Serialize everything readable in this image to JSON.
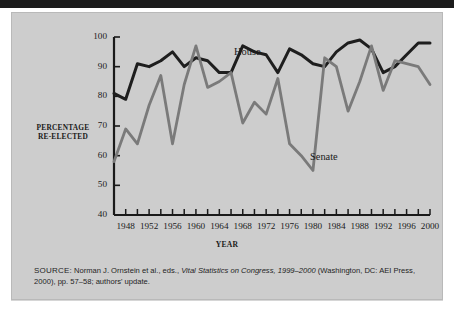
{
  "figure": {
    "ylabel_line1": "PERCENTAGE",
    "ylabel_line2": "RE-ELECTED",
    "xlabel": "YEAR",
    "source_keyword": "SOURCE:",
    "source_text_1": " Norman J. Ornstein et al., eds., ",
    "source_title": "Vital Statistics on Congress, 1999–2000",
    "source_text_2": " (Washington, DC: AEI Press, 2000), pp. 57–58; authors' update."
  },
  "chart_data": {
    "type": "line",
    "title": "",
    "xlabel": "YEAR",
    "ylabel": "PERCENTAGE RE-ELECTED",
    "xlim": [
      1946,
      2000
    ],
    "ylim": [
      40,
      100
    ],
    "yticks": [
      40,
      50,
      60,
      70,
      80,
      90,
      100
    ],
    "xticks": [
      1948,
      1952,
      1956,
      1960,
      1964,
      1968,
      1972,
      1976,
      1980,
      1984,
      1988,
      1992,
      1996,
      2000
    ],
    "xticks_minor": [
      1946,
      1950,
      1954,
      1958,
      1962,
      1966,
      1970,
      1974,
      1978,
      1982,
      1986,
      1990,
      1994,
      1998
    ],
    "grid": false,
    "legend": "inline-annotations",
    "x": [
      1946,
      1948,
      1950,
      1952,
      1954,
      1956,
      1958,
      1960,
      1962,
      1964,
      1966,
      1968,
      1970,
      1972,
      1974,
      1976,
      1978,
      1980,
      1982,
      1984,
      1986,
      1988,
      1990,
      1992,
      1994,
      1996,
      1998,
      2000
    ],
    "series": [
      {
        "name": "House",
        "color": "#1e1e1e",
        "values": [
          81,
          79,
          91,
          90,
          92,
          95,
          90,
          93,
          92,
          88,
          88,
          97,
          95,
          94,
          88,
          96,
          94,
          91,
          90,
          95,
          98,
          99,
          96,
          88,
          90,
          94,
          98,
          98
        ]
      },
      {
        "name": "Senate",
        "color": "#7a7a7a",
        "values": [
          58,
          69,
          64,
          77,
          87,
          64,
          84,
          97,
          83,
          85,
          88,
          71,
          78,
          74,
          86,
          64,
          60,
          55,
          93,
          90,
          75,
          85,
          97,
          82,
          92,
          91,
          90,
          84
        ]
      }
    ],
    "annotations": [
      {
        "text": "House",
        "x": 1968,
        "y": 100
      },
      {
        "text": "Senate",
        "x": 1979,
        "y": 68
      }
    ]
  }
}
